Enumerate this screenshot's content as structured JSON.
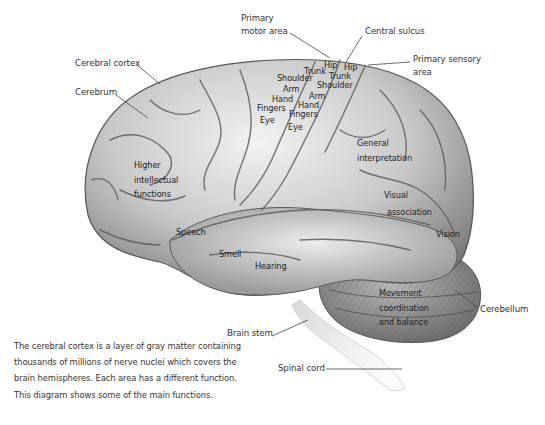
{
  "diagram": {
    "colors": {
      "background": "#ffffff",
      "brain_light": "#e6e6e6",
      "brain_mid": "#b9b9b9",
      "brain_dark": "#6f6f6f",
      "label_text": "#333333",
      "leader_line": "#444444"
    }
  },
  "labels": {
    "primary_motor_area": [
      "Primary",
      "motor area"
    ],
    "central_sulcus": "Central sulcus",
    "primary_sensory_area": [
      "Primary sensory",
      "area"
    ],
    "cerebral_cortex": "Cerebral cortex",
    "cerebrum": "Cerebrum",
    "cerebellum": "Cerebellum",
    "brain_stem": "Brain stem",
    "spinal_cord": "Spinal cord"
  },
  "motor_strip": [
    "Hip",
    "Trunk",
    "Shoulder",
    "Arm",
    "Hand",
    "Fingers",
    "Eye"
  ],
  "sensory_strip": [
    "Hip",
    "Trunk",
    "Shoulder",
    "Arm",
    "Hand",
    "Fingers",
    "Eye"
  ],
  "regions": {
    "higher_intellectual": [
      "Higher",
      "intellectual",
      "functions"
    ],
    "speech": "Speech",
    "smell": "Smell",
    "hearing": "Hearing",
    "general_interpretation": [
      "General",
      "interpretation"
    ],
    "visual_association": [
      "Visual",
      "association"
    ],
    "vision": "Vision",
    "movement": [
      "Movement",
      "coordination",
      "and balance"
    ]
  },
  "caption": "The cerebral cortex is a layer of gray matter containing thousands of millions of nerve nuclei which covers the brain hemispheres. Each area has a different function. This diagram shows some of the main functions."
}
